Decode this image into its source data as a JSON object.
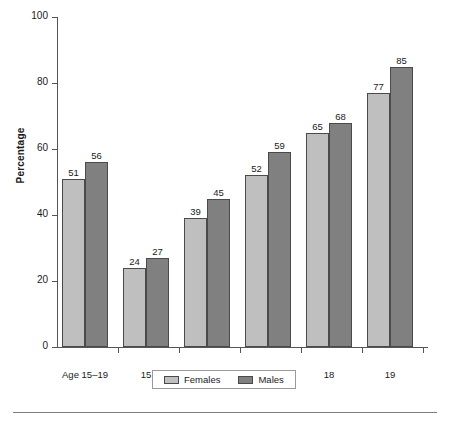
{
  "chart_data": {
    "type": "bar",
    "title": "",
    "subtitle": "",
    "xlabel": "",
    "ylabel": "Percentage",
    "ylim": [
      0,
      100
    ],
    "yticks": [
      0,
      20,
      40,
      60,
      80,
      100
    ],
    "ytick_labels": [
      "0",
      "20",
      "40",
      "60",
      "80",
      "100"
    ],
    "grid": false,
    "legend_position": "bottom",
    "categories": [
      "Age 15–19",
      "15",
      "16",
      "17",
      "18",
      "19"
    ],
    "series": [
      {
        "name": "Females",
        "color": "#bfbfbf",
        "values": [
          51,
          24,
          39,
          52,
          65,
          77
        ]
      },
      {
        "name": "Males",
        "color": "#808080",
        "values": [
          56,
          27,
          45,
          59,
          68,
          85
        ]
      }
    ],
    "data_labels": [
      [
        "51",
        "56"
      ],
      [
        "24",
        "27"
      ],
      [
        "39",
        "45"
      ],
      [
        "52",
        "59"
      ],
      [
        "65",
        "68"
      ],
      [
        "77",
        "85"
      ]
    ]
  },
  "legend": {
    "items": [
      {
        "label": "Females",
        "color": "#bfbfbf"
      },
      {
        "label": "Males",
        "color": "#808080"
      }
    ]
  },
  "colors": {
    "females": "#bfbfbf",
    "males": "#808080",
    "axis": "#555555",
    "text": "#1a1a1a",
    "rule": "#7d7d7d"
  }
}
